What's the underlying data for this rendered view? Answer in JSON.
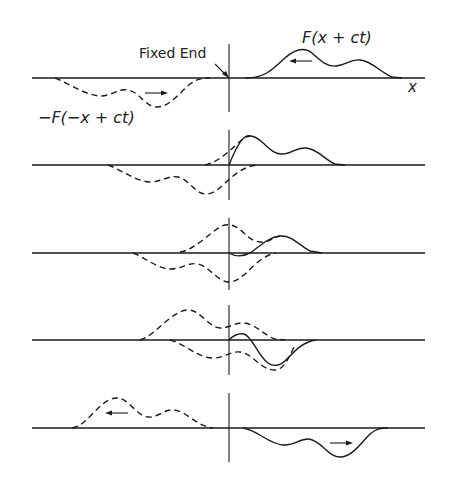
{
  "figure": {
    "labels": {
      "fixed_end": "Fixed End",
      "incident_wave": "F(x + ct)",
      "reflected_wave": "−F(−x + ct)",
      "x_axis": "x"
    },
    "panels": [
      {
        "index": 1,
        "description": "Incident pulse F(x+ct) right of fixed end moving left; inverted image pulse -F(-x+ct) left of fixed end moving right",
        "arrows": [
          "left (solid pulse)",
          "right (dashed pulse)"
        ]
      },
      {
        "index": 2,
        "description": "Pulse front reaches fixed end; dashed image begins overlapping"
      },
      {
        "index": 3,
        "description": "Pulse partially reflected; large superposition near fixed end"
      },
      {
        "index": 4,
        "description": "Reflected inverted pulse emerging to the right of fixed end"
      },
      {
        "index": 5,
        "description": "Fully reflected inverted pulse moves right; image pulse to the left moves left",
        "arrows": [
          "left (dashed pulse)",
          "right (solid pulse)"
        ]
      }
    ],
    "legend": {
      "solid_line": "actual string displacement",
      "dashed_line": "component waves (incident / virtual image)"
    },
    "colors": {
      "line": "#1a1a1a",
      "background": "#ffffff"
    }
  }
}
